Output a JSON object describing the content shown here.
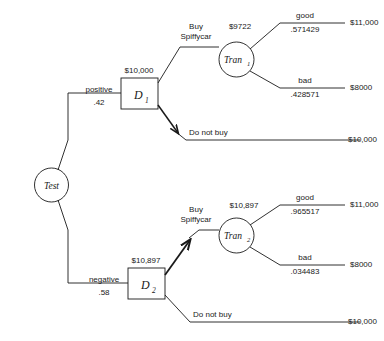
{
  "diagram": {
    "type": "decision-tree",
    "title": "",
    "root": {
      "name": "Test",
      "label": "Test",
      "shape": "circle"
    },
    "branches": [
      {
        "id": "positive",
        "label": "positive",
        "probability": ".42",
        "decision_node": {
          "label": "D",
          "subscript": "1",
          "value": "$10,000",
          "shape": "square"
        },
        "options": [
          {
            "id": "buy-spiffycar",
            "label_line1": "Buy",
            "label_line2": "Spiffycar",
            "preferred": false,
            "chance_node": {
              "label": "Tran",
              "subscript": "1",
              "value": "$9722",
              "shape": "circle"
            },
            "outcomes": [
              {
                "label": "good",
                "probability": ".571429",
                "payoff": "$11,000"
              },
              {
                "label": "bad",
                "probability": ".428571",
                "payoff": "$8000"
              }
            ]
          },
          {
            "id": "do-not-buy",
            "label": "Do not buy",
            "preferred": true,
            "payoff": "$10,000"
          }
        ]
      },
      {
        "id": "negative",
        "label": "negative",
        "probability": ".58",
        "decision_node": {
          "label": "D",
          "subscript": "2",
          "value": "$10,897",
          "shape": "square"
        },
        "options": [
          {
            "id": "buy-spiffycar",
            "label_line1": "Buy",
            "label_line2": "Spiffycar",
            "preferred": true,
            "chance_node": {
              "label": "Tran",
              "subscript": "2",
              "value": "$10,897",
              "shape": "circle"
            },
            "outcomes": [
              {
                "label": "good",
                "probability": ".965517",
                "payoff": "$11,000"
              },
              {
                "label": "bad",
                "probability": ".034483",
                "payoff": "$8000"
              }
            ]
          },
          {
            "id": "do-not-buy",
            "label": "Do not buy",
            "preferred": false,
            "payoff": "$10,000"
          }
        ]
      }
    ],
    "colors": {
      "stroke": "#1a1a1a",
      "text": "#1a1a1a",
      "background": "#ffffff"
    }
  }
}
